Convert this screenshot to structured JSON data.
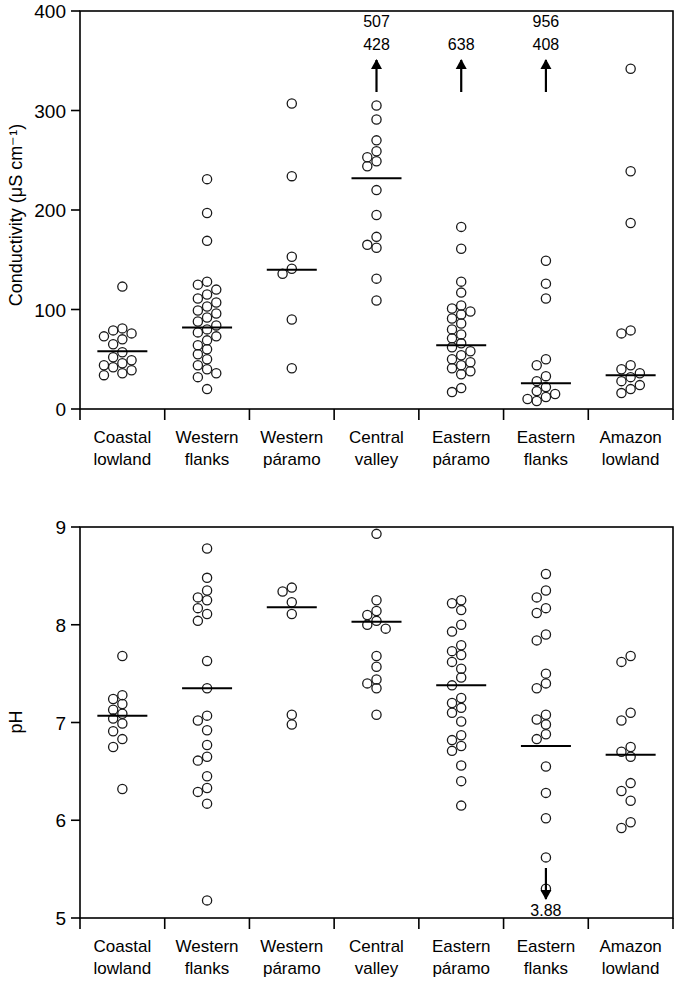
{
  "figure": {
    "categories": [
      "Coastal lowland",
      "Western flanks",
      "Western páramo",
      "Central valley",
      "Eastern páramo",
      "Eastern flanks",
      "Amazon lowland"
    ],
    "category_lines": [
      [
        "Coastal",
        "lowland"
      ],
      [
        "Western",
        "flanks"
      ],
      [
        "Western",
        "páramo"
      ],
      [
        "Central",
        "valley"
      ],
      [
        "Eastern",
        "páramo"
      ],
      [
        "Eastern",
        "flanks"
      ],
      [
        "Amazon",
        "lowland"
      ]
    ]
  },
  "chart_data": [
    {
      "type": "scatter",
      "id": "conductivity",
      "title": "",
      "xlabel": "",
      "ylabel": "Conductivity (μS cm⁻¹)",
      "ylim": [
        0,
        400
      ],
      "yticks": [
        0,
        100,
        200,
        300,
        400
      ],
      "ytick_labels": [
        "0",
        "100",
        "200",
        "300",
        "400"
      ],
      "grid": false,
      "legend": "none",
      "categories": [
        "Coastal lowland",
        "Western flanks",
        "Western páramo",
        "Central valley",
        "Eastern páramo",
        "Eastern flanks",
        "Amazon lowland"
      ],
      "series": [
        {
          "name": "Coastal lowland",
          "median": 58,
          "values": [
            123,
            81,
            79,
            76,
            73,
            70,
            65,
            57,
            52,
            49,
            46,
            44,
            42,
            39,
            36,
            34
          ]
        },
        {
          "name": "Western flanks",
          "median": 82,
          "values": [
            231,
            197,
            169,
            128,
            125,
            120,
            115,
            111,
            107,
            103,
            99,
            96,
            92,
            88,
            84,
            80,
            77,
            73,
            69,
            64,
            60,
            55,
            50,
            44,
            40,
            36,
            32,
            20
          ]
        },
        {
          "name": "Western páramo",
          "median": 140,
          "values": [
            307,
            234,
            153,
            141,
            136,
            90,
            41
          ]
        },
        {
          "name": "Central valley",
          "median": 232,
          "values": [
            305,
            291,
            270,
            259,
            253,
            249,
            244,
            220,
            195,
            173,
            165,
            162,
            131,
            109
          ],
          "above_range": [
            507,
            428
          ]
        },
        {
          "name": "Eastern páramo",
          "median": 64,
          "values": [
            183,
            161,
            128,
            117,
            104,
            101,
            98,
            95,
            91,
            86,
            80,
            75,
            71,
            66,
            62,
            58,
            54,
            50,
            47,
            44,
            41,
            38,
            35,
            21,
            17
          ],
          "above_range": [
            638
          ]
        },
        {
          "name": "Eastern flanks",
          "median": 26,
          "values": [
            149,
            126,
            111,
            50,
            44,
            33,
            28,
            22,
            18,
            15,
            12,
            10,
            8
          ],
          "above_range": [
            956,
            408
          ]
        },
        {
          "name": "Amazon lowland",
          "median": 34,
          "values": [
            342,
            239,
            187,
            79,
            76,
            44,
            40,
            36,
            32,
            28,
            24,
            20,
            16
          ]
        }
      ]
    },
    {
      "type": "scatter",
      "id": "ph",
      "title": "",
      "xlabel": "",
      "ylabel": "pH",
      "ylim": [
        5,
        9
      ],
      "yticks": [
        5,
        6,
        7,
        8,
        9
      ],
      "ytick_labels": [
        "5",
        "6",
        "7",
        "8",
        "9"
      ],
      "grid": false,
      "legend": "none",
      "categories": [
        "Coastal lowland",
        "Western flanks",
        "Western páramo",
        "Central valley",
        "Eastern páramo",
        "Eastern flanks",
        "Amazon lowland"
      ],
      "series": [
        {
          "name": "Coastal lowland",
          "median": 7.07,
          "values": [
            7.68,
            7.28,
            7.24,
            7.19,
            7.13,
            7.09,
            7.04,
            6.99,
            6.91,
            6.83,
            6.75,
            6.32
          ]
        },
        {
          "name": "Western flanks",
          "median": 7.35,
          "values": [
            8.78,
            8.48,
            8.35,
            8.28,
            8.25,
            8.17,
            8.11,
            8.04,
            7.63,
            7.35,
            7.07,
            7.02,
            6.92,
            6.77,
            6.65,
            6.61,
            6.45,
            6.33,
            6.29,
            6.17,
            5.18
          ]
        },
        {
          "name": "Western páramo",
          "median": 8.18,
          "values": [
            8.38,
            8.34,
            8.23,
            8.11,
            7.08,
            6.98
          ]
        },
        {
          "name": "Central valley",
          "median": 8.03,
          "values": [
            8.93,
            8.25,
            8.14,
            8.1,
            8.04,
            8.0,
            7.96,
            7.68,
            7.57,
            7.44,
            7.4,
            7.35,
            7.08
          ]
        },
        {
          "name": "Eastern páramo",
          "median": 7.38,
          "values": [
            8.25,
            8.22,
            8.15,
            8.0,
            7.93,
            7.79,
            7.73,
            7.69,
            7.62,
            7.55,
            7.46,
            7.38,
            7.25,
            7.2,
            7.15,
            7.1,
            7.01,
            6.87,
            6.82,
            6.76,
            6.71,
            6.56,
            6.4,
            6.15
          ]
        },
        {
          "name": "Eastern flanks",
          "median": 6.76,
          "values": [
            8.52,
            8.35,
            8.28,
            8.17,
            8.12,
            7.9,
            7.84,
            7.5,
            7.4,
            7.35,
            7.08,
            7.03,
            6.98,
            6.88,
            6.83,
            6.55,
            6.28,
            6.02,
            5.62,
            5.3
          ],
          "below_range": [
            3.88
          ]
        },
        {
          "name": "Amazon lowland",
          "median": 6.67,
          "values": [
            7.68,
            7.62,
            7.1,
            7.02,
            6.75,
            6.7,
            6.65,
            6.38,
            6.3,
            6.2,
            5.98,
            5.92
          ]
        }
      ]
    }
  ],
  "annotations": {
    "conductivity_above": [
      {
        "category": "Central valley",
        "labels": [
          "507",
          "428"
        ]
      },
      {
        "category": "Eastern páramo",
        "labels": [
          "638"
        ]
      },
      {
        "category": "Eastern flanks",
        "labels": [
          "956",
          "408"
        ]
      }
    ],
    "ph_below": [
      {
        "category": "Eastern flanks",
        "labels": [
          "3.88"
        ]
      }
    ]
  }
}
